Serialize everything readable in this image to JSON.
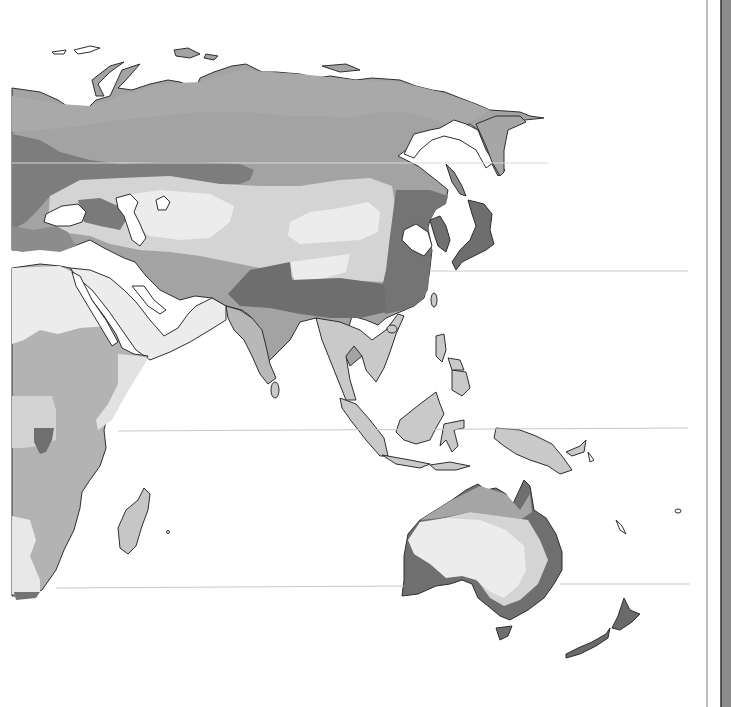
{
  "map": {
    "type": "thematic-grayscale-map",
    "region": "Eurasia, Africa, Australasia",
    "width": 731,
    "height": 707,
    "colors": {
      "sea": "#ffffff",
      "zone_lightest": "#eeeeee",
      "zone_light": "#d5d5d5",
      "zone_mid": "#b8b8b8",
      "zone_mid_dark": "#a2a2a2",
      "zone_dark": "#707070",
      "coastline": "#2e2e2e",
      "graticule": "#c9c9c9",
      "panel_line": "#bdbdbd",
      "panel_bar": "#8c8c8c",
      "panel_bar_edge": "#333333"
    },
    "graticule_y": [
      163,
      271,
      430,
      585
    ],
    "labels": []
  },
  "panel": {
    "divider_x": 706,
    "bar_x": 722
  }
}
